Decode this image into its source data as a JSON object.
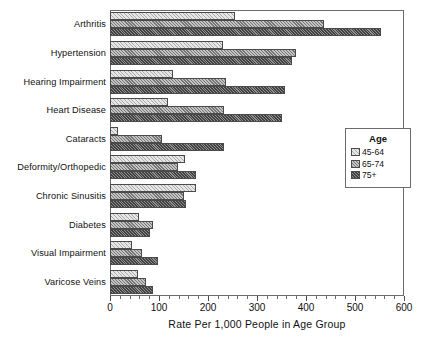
{
  "chart_data": {
    "type": "bar",
    "orientation": "horizontal",
    "title": "",
    "xlabel": "Rate Per 1,000 People in Age Group",
    "ylabel": "",
    "xlim": [
      0,
      600
    ],
    "xticks": [
      0,
      100,
      200,
      300,
      400,
      500,
      600
    ],
    "xtick_labels": [
      "0",
      "100",
      "200",
      "300",
      "400",
      "500",
      "600"
    ],
    "minor_tick_interval": 20,
    "grid": false,
    "legend_title": "Age",
    "legend_position": "right-middle",
    "categories": [
      "Arthritis",
      "Hypertension",
      "Hearing Impairment",
      "Heart Disease",
      "Cataracts",
      "Deformity/Orthopedic",
      "Chronic Sinusitis",
      "Diabetes",
      "Visual Impairment",
      "Varicose Veins"
    ],
    "series": [
      {
        "name": "45-64",
        "fill": "#e6e6e6",
        "values": [
          255,
          230,
          128,
          118,
          16,
          153,
          175,
          60,
          45,
          58
        ]
      },
      {
        "name": "65-74",
        "fill": "#c4c4c4",
        "values": [
          437,
          380,
          237,
          232,
          107,
          139,
          151,
          88,
          65,
          73
        ]
      },
      {
        "name": "75+",
        "fill": "#8f8f8f",
        "values": [
          554,
          372,
          357,
          350,
          233,
          175,
          155,
          82,
          98,
          88
        ]
      }
    ]
  },
  "legend": {
    "title": "Age",
    "entries": [
      {
        "label": "45-64"
      },
      {
        "label": "65-74"
      },
      {
        "label": "75+"
      }
    ]
  },
  "axis": {
    "x_title": "Rate Per 1,000 People in Age Group"
  }
}
